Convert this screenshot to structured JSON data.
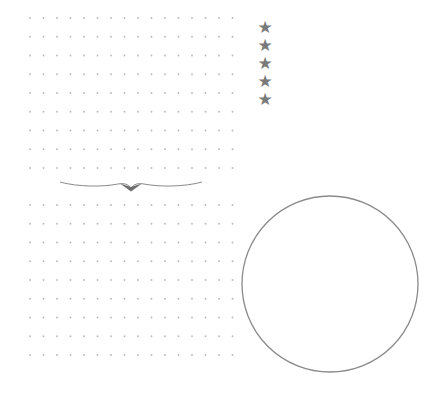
{
  "page": {
    "background": "#ffffff"
  },
  "dot_grids": [
    {
      "name": "top-dot-grid",
      "x": 30,
      "y": 18,
      "cols": 16,
      "rows": 9,
      "col_spacing": 13.5,
      "row_spacing": 18.75,
      "dot_color": "#b8b8b8",
      "dot_radius": 0.9
    },
    {
      "name": "bottom-dot-grid",
      "x": 30,
      "y": 205,
      "cols": 16,
      "rows": 9,
      "col_spacing": 13.5,
      "row_spacing": 18.75,
      "dot_color": "#b8b8b8",
      "dot_radius": 0.9
    }
  ],
  "stars": {
    "glyph": "★",
    "count": 5,
    "color": "#7a7a7a",
    "items": [
      "★",
      "★",
      "★",
      "★",
      "★"
    ]
  },
  "divider": {
    "color": "#8a8a8a",
    "accent_color": "#6e6e6e"
  },
  "circle": {
    "cx": 330,
    "cy": 284,
    "r": 88,
    "stroke": "#8a8a8a",
    "stroke_width": 1.3
  }
}
